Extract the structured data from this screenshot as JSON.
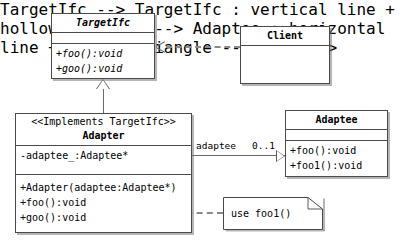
{
  "diagram": {
    "colors": {
      "background": "#ffffff",
      "box_border": "#4a4a4a",
      "line": "#6a6a6a",
      "dashed_line": "#8a8a8a",
      "shadow": "rgba(120,120,120,0.55)",
      "text": "#000000"
    }
  },
  "classes": {
    "target_ifc": {
      "name": "TargetIfc",
      "italic": true,
      "attributes": [],
      "operations": [
        "+foo():void",
        "+goo():void"
      ]
    },
    "client": {
      "name": "Client",
      "italic": false,
      "attributes": [],
      "operations": []
    },
    "adapter": {
      "stereotype": "<<Implements TargetIfc>>",
      "name": "Adapter",
      "italic": false,
      "attributes": [
        "-adaptee_:Adaptee*"
      ],
      "operations": [
        "+Adapter(adaptee:Adaptee*)",
        "+foo():void",
        "+goo():void"
      ]
    },
    "adaptee": {
      "name": "Adaptee",
      "italic": false,
      "attributes": [],
      "operations": [
        "+foo():void",
        "+foo1():void"
      ]
    }
  },
  "relationships": {
    "client_to_target": {
      "kind": "dependency",
      "style": "dashed",
      "arrowhead": "open-line",
      "from": "Client",
      "to": "TargetIfc"
    },
    "adapter_to_target": {
      "kind": "realization",
      "style": "solid",
      "arrowhead": "hollow-triangle",
      "from": "Adapter",
      "to": "TargetIfc"
    },
    "adapter_to_adaptee": {
      "kind": "association",
      "style": "solid",
      "arrowhead": "hollow-triangle",
      "from": "Adapter",
      "to": "Adaptee",
      "role_label": "adaptee",
      "multiplicity": "0..1"
    },
    "adapter_to_note": {
      "kind": "note-anchor",
      "style": "dashed",
      "arrowhead": "none",
      "from": "Adapter",
      "to": "note"
    }
  },
  "note": {
    "text": "use foo1()"
  }
}
